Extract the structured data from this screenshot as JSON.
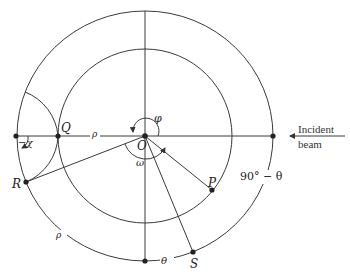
{
  "diagram": {
    "type": "geometric construction",
    "points": {
      "O": {
        "label": "O"
      },
      "Q": {
        "label": "Q"
      },
      "R": {
        "label": "R"
      },
      "P": {
        "label": "P"
      },
      "S": {
        "label": "S"
      }
    },
    "angle_labels": {
      "phi": "φ",
      "omega": "ω",
      "chi": "−χ",
      "theta": "θ",
      "ninety_minus_theta": "90° − θ"
    },
    "length_labels": {
      "rho_radius": "ρ",
      "rho_arc": "ρ"
    },
    "incident_beam": {
      "line1": "Incident",
      "line2": "beam"
    },
    "colors": {
      "stroke": "#333333",
      "text": "#222222",
      "background": "#ffffff"
    }
  }
}
